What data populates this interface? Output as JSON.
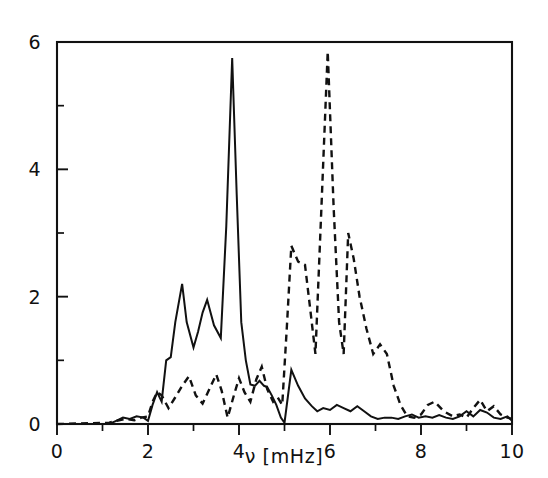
{
  "chart_data": {
    "type": "line",
    "title": "",
    "xlabel": "ν [mHz]",
    "ylabel": "",
    "xlim": [
      0,
      10
    ],
    "ylim": [
      0,
      6
    ],
    "grid": false,
    "legend": "none",
    "xticks": [
      0,
      1,
      2,
      3,
      4,
      5,
      6,
      7,
      8,
      9,
      10
    ],
    "xtick_labels": [
      "0",
      "",
      "2",
      "",
      "4",
      "",
      "6",
      "",
      "8",
      "",
      "10"
    ],
    "yticks": [
      0,
      1,
      2,
      3,
      4,
      5,
      6
    ],
    "ytick_labels": [
      "0",
      "",
      "2",
      "",
      "4",
      "",
      "6"
    ],
    "series": [
      {
        "name": "solid",
        "style": "solid",
        "color": "#111111",
        "x": [
          0.0,
          1.15,
          1.3,
          1.45,
          1.6,
          1.75,
          1.9,
          2.0,
          2.1,
          2.2,
          2.3,
          2.4,
          2.5,
          2.6,
          2.75,
          2.85,
          3.0,
          3.1,
          3.2,
          3.3,
          3.45,
          3.6,
          3.72,
          3.85,
          3.95,
          4.05,
          4.15,
          4.25,
          4.35,
          4.45,
          4.55,
          4.62,
          4.72,
          4.82,
          4.92,
          5.0,
          5.15,
          5.3,
          5.45,
          5.6,
          5.72,
          5.85,
          6.0,
          6.15,
          6.3,
          6.45,
          6.6,
          6.75,
          6.9,
          7.05,
          7.2,
          7.35,
          7.5,
          7.65,
          7.8,
          7.95,
          8.1,
          8.25,
          8.4,
          8.55,
          8.7,
          8.85,
          9.0,
          9.15,
          9.3,
          9.45,
          9.6,
          9.75,
          9.9,
          10.0
        ],
        "y": [
          0.0,
          0.0,
          0.05,
          0.1,
          0.08,
          0.12,
          0.1,
          0.05,
          0.3,
          0.5,
          0.35,
          1.0,
          1.05,
          1.6,
          2.2,
          1.6,
          1.2,
          1.45,
          1.75,
          1.95,
          1.55,
          1.35,
          3.1,
          5.75,
          3.6,
          1.6,
          1.0,
          0.62,
          0.6,
          0.68,
          0.6,
          0.58,
          0.45,
          0.3,
          0.1,
          0.02,
          0.85,
          0.6,
          0.4,
          0.28,
          0.2,
          0.25,
          0.22,
          0.3,
          0.25,
          0.2,
          0.28,
          0.2,
          0.12,
          0.08,
          0.1,
          0.1,
          0.08,
          0.12,
          0.15,
          0.1,
          0.12,
          0.1,
          0.14,
          0.1,
          0.08,
          0.12,
          0.2,
          0.12,
          0.22,
          0.18,
          0.1,
          0.08,
          0.12,
          0.05
        ]
      },
      {
        "name": "dashed",
        "style": "dashed",
        "color": "#111111",
        "x": [
          0.0,
          1.15,
          1.3,
          1.5,
          1.7,
          1.85,
          2.0,
          2.1,
          2.2,
          2.3,
          2.45,
          2.6,
          2.75,
          2.9,
          3.05,
          3.2,
          3.35,
          3.5,
          3.62,
          3.75,
          3.9,
          4.0,
          4.12,
          4.25,
          4.38,
          4.5,
          4.62,
          4.75,
          4.85,
          4.95,
          5.05,
          5.15,
          5.3,
          5.45,
          5.55,
          5.68,
          5.8,
          5.95,
          6.08,
          6.2,
          6.3,
          6.4,
          6.52,
          6.65,
          6.8,
          6.95,
          7.1,
          7.25,
          7.4,
          7.55,
          7.7,
          7.85,
          8.0,
          8.15,
          8.3,
          8.5,
          8.7,
          8.85,
          9.0,
          9.15,
          9.3,
          9.45,
          9.6,
          9.75,
          9.9,
          10.0
        ],
        "y": [
          0.0,
          0.02,
          0.05,
          0.08,
          0.06,
          0.1,
          0.12,
          0.35,
          0.5,
          0.45,
          0.25,
          0.42,
          0.6,
          0.75,
          0.45,
          0.32,
          0.55,
          0.78,
          0.52,
          0.1,
          0.48,
          0.72,
          0.5,
          0.35,
          0.7,
          0.9,
          0.55,
          0.35,
          0.42,
          0.3,
          1.5,
          2.8,
          2.55,
          2.5,
          1.9,
          1.1,
          3.2,
          5.85,
          3.4,
          1.6,
          1.1,
          3.0,
          2.6,
          2.0,
          1.5,
          1.1,
          1.25,
          1.1,
          0.6,
          0.3,
          0.12,
          0.1,
          0.15,
          0.3,
          0.35,
          0.2,
          0.12,
          0.15,
          0.1,
          0.25,
          0.38,
          0.2,
          0.28,
          0.15,
          0.1,
          0.08
        ]
      }
    ]
  }
}
